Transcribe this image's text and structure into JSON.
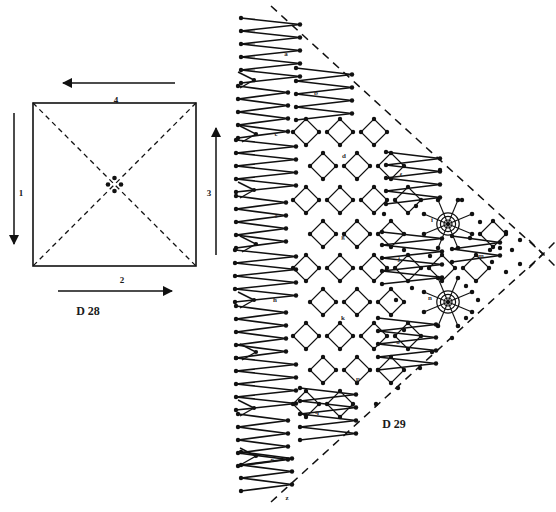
{
  "page": {
    "background": "#ffffff",
    "ink": "#111111",
    "width": 556,
    "height": 512
  },
  "figures": [
    {
      "id": "d28",
      "caption": "D 28",
      "type": "square-pricking-with-diagonals",
      "description": "Square outline with dashed diagonals meeting at four centre dots, surrounded by four numbered direction arrows",
      "square": {
        "x": 33,
        "y": 103,
        "size": 163
      },
      "centre_dots": 4,
      "arrows": [
        {
          "label": "1",
          "side": "left",
          "direction": "down",
          "label_x": 21,
          "label_y": 193
        },
        {
          "label": "2",
          "side": "bottom",
          "direction": "right",
          "label_x": 122,
          "label_y": 280
        },
        {
          "label": "3",
          "side": "right",
          "direction": "up",
          "label_x": 208,
          "label_y": 193
        },
        {
          "label": "4",
          "side": "top",
          "direction": "left",
          "label_x": 115,
          "label_y": 100
        }
      ],
      "caption_x": 88,
      "caption_y": 311
    },
    {
      "id": "d29",
      "caption": "D 29",
      "type": "triangular-shawl-pricking",
      "description": "Triangular half-handkerchief lace pricking: dashed outline, zig-zag fan bands on the outer edge, diamond point-ground net in the middle, and two spider/rose motifs",
      "caption_x": 368,
      "caption_y": 424,
      "outline": {
        "apex_left_top": [
          271,
          6
        ],
        "apex_right": [
          543,
          254
        ],
        "apex_left_bottom": [
          271,
          502
        ],
        "style": "dashed"
      },
      "motif_labels": [
        {
          "text": "a",
          "x": 286,
          "y": 56
        },
        {
          "text": "b",
          "x": 316,
          "y": 95
        },
        {
          "text": "c",
          "x": 276,
          "y": 136
        },
        {
          "text": "d",
          "x": 344,
          "y": 158
        },
        {
          "text": "e",
          "x": 276,
          "y": 218
        },
        {
          "text": "f",
          "x": 401,
          "y": 177
        },
        {
          "text": "g",
          "x": 343,
          "y": 239
        },
        {
          "text": "h",
          "x": 275,
          "y": 302
        },
        {
          "text": "i",
          "x": 432,
          "y": 222
        },
        {
          "text": "j",
          "x": 399,
          "y": 261
        },
        {
          "text": "k",
          "x": 343,
          "y": 320
        },
        {
          "text": "m",
          "x": 481,
          "y": 258
        },
        {
          "text": "n",
          "x": 430,
          "y": 300
        },
        {
          "text": "o",
          "x": 398,
          "y": 344
        },
        {
          "text": "p",
          "x": 358,
          "y": 381
        },
        {
          "text": "q",
          "x": 317,
          "y": 414
        },
        {
          "text": "r",
          "x": 272,
          "y": 462
        },
        {
          "text": "z",
          "x": 287,
          "y": 500
        }
      ],
      "spiders": [
        {
          "label": "i",
          "cx": 448,
          "cy": 224,
          "rings": 3,
          "legs": 8
        },
        {
          "label": "n",
          "cx": 448,
          "cy": 302,
          "rings": 3,
          "legs": 8
        }
      ]
    }
  ]
}
